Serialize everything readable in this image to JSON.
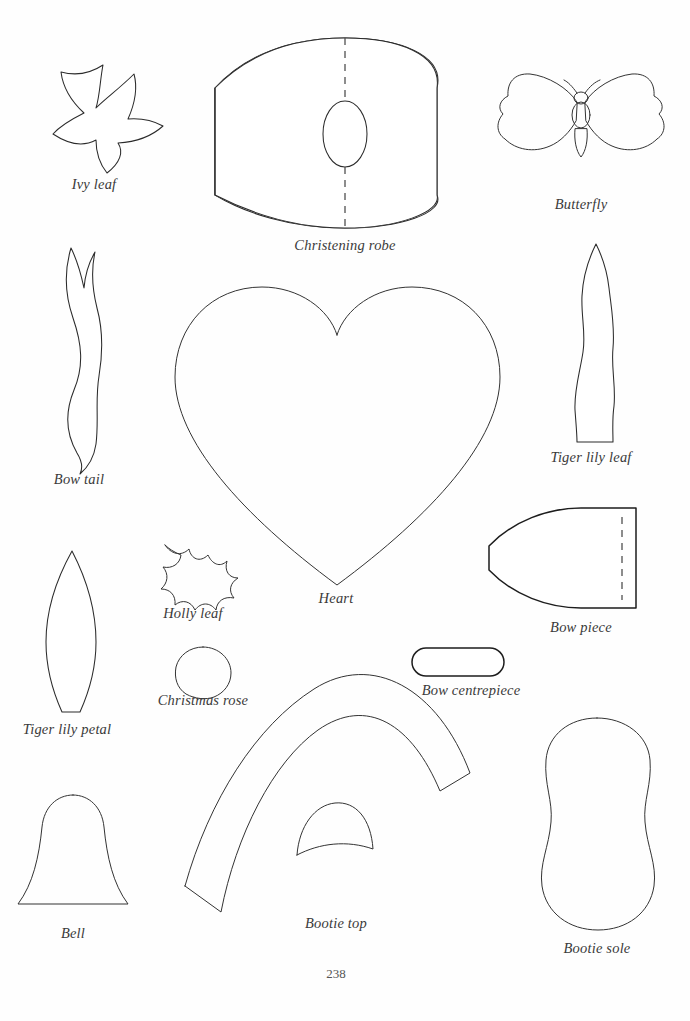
{
  "page": {
    "folio": "238",
    "background_color": "#ffffff",
    "ink_color": "#2b2b2b"
  },
  "templates": [
    {
      "id": "ivy-leaf",
      "label": "Ivy leaf",
      "shape": "five-pointed ivy leaf",
      "label_x": 94,
      "label_y": 176
    },
    {
      "id": "christening-robe",
      "label": "Christening robe",
      "shape": "barrel shape with straight side edges, central dashed fold line and oval neck opening",
      "label_x": 345,
      "label_y": 237
    },
    {
      "id": "butterfly",
      "label": "Butterfly",
      "shape": "butterfly with two pairs of wings, body segments and antennae",
      "label_x": 581,
      "label_y": 200
    },
    {
      "id": "bow-tail",
      "label": "Bow tail",
      "shape": "wavy ribbon tail with notched V top",
      "label_x": 79,
      "label_y": 478
    },
    {
      "id": "heart",
      "label": "Heart",
      "shape": "large symmetrical heart",
      "label_x": 336,
      "label_y": 597
    },
    {
      "id": "tiger-lily-leaf",
      "label": "Tiger lily leaf",
      "shape": "tall narrow wavy leaf with pointed tip and flat base",
      "label_x": 591,
      "label_y": 456
    },
    {
      "id": "tiger-lily-petal",
      "label": "Tiger lily petal",
      "shape": "long pointed lens-shaped petal with flat base",
      "label_x": 67,
      "label_y": 728
    },
    {
      "id": "holly-leaf",
      "label": "Holly leaf",
      "shape": "spiky holly leaf with eight points",
      "label_x": 193,
      "label_y": 612
    },
    {
      "id": "christmas-rose",
      "label": "Christmas rose",
      "shape": "small egg-shaped petal",
      "label_x": 203,
      "label_y": 699
    },
    {
      "id": "bow-piece",
      "label": "Bow piece",
      "shape": "rounded wedge with straight left edge and dashed fold line near right edge",
      "label_x": 581,
      "label_y": 626
    },
    {
      "id": "bow-centrepiece",
      "label": "Bow centrepiece",
      "shape": "rounded-end rectangle (stadium)",
      "label_x": 471,
      "label_y": 689
    },
    {
      "id": "bootie-top",
      "label": "Bootie top",
      "shape": "wide curved arch band with inner arch cut-out",
      "label_x": 336,
      "label_y": 921
    },
    {
      "id": "bootie-sole",
      "label": "Bootie sole",
      "shape": "peanut / figure-eight shaped sole",
      "label_x": 597,
      "label_y": 947
    },
    {
      "id": "bell",
      "label": "Bell",
      "shape": "bell with flared skirt and flat base",
      "label_x": 73,
      "label_y": 932
    }
  ]
}
